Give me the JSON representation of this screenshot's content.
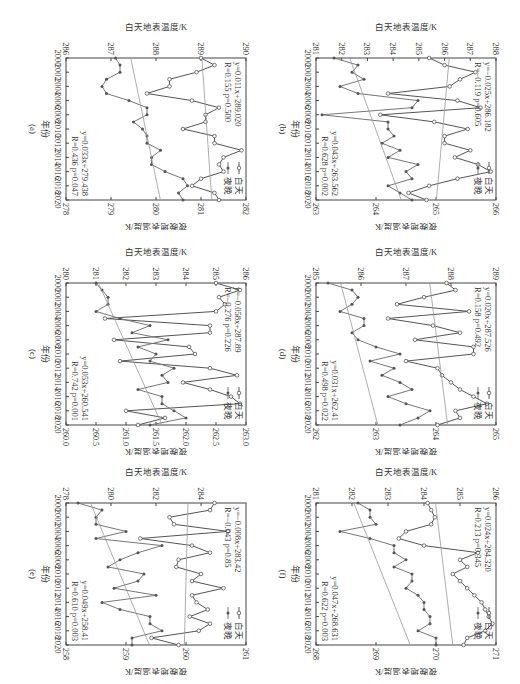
{
  "figure": {
    "rotation": "90deg clockwise",
    "legend": {
      "day": "白天",
      "night": "夜晚"
    },
    "x_label": "年份",
    "left_ylabel": "白天地表温度/K",
    "right_ylabel": "夜晚地表温度/K"
  },
  "chart_data": [
    {
      "panel": "(a)",
      "type": "line",
      "title": "(a)",
      "xlabel": "年份",
      "ylabel": "白天地表温度/K",
      "ylabel_right": "夜晚地表温度/K",
      "x": [
        2000,
        2001,
        2002,
        2003,
        2004,
        2005,
        2006,
        2007,
        2008,
        2009,
        2010,
        2011,
        2012,
        2013,
        2014,
        2015,
        2016,
        2017,
        2018,
        2019,
        2020
      ],
      "xticks": [
        2000,
        2002,
        2004,
        2006,
        2008,
        2010,
        2012,
        2014,
        2016,
        2018,
        2020
      ],
      "ylim": [
        286,
        290
      ],
      "yticks": [
        286,
        287,
        288,
        289,
        290
      ],
      "ylim_right": [
        278,
        282
      ],
      "yticks_right": [
        278,
        279,
        280,
        281,
        282
      ],
      "series": [
        {
          "name": "白天",
          "axis": "left",
          "marker": "open-circle",
          "values": [
            289.0,
            289.3,
            288.9,
            288.3,
            288.3,
            287.8,
            288.8,
            289.4,
            289.1,
            289.1,
            288.6,
            289.3,
            289.3,
            289.9,
            289.5,
            289.4,
            289.5,
            289.0,
            288.8,
            289.3,
            289.4
          ]
        },
        {
          "name": "夜晚",
          "axis": "right",
          "marker": "filled-dot",
          "values": [
            279.1,
            279.2,
            279.2,
            278.9,
            278.8,
            278.9,
            279.4,
            279.8,
            279.8,
            279.5,
            279.7,
            279.8,
            279.8,
            280.1,
            279.9,
            279.9,
            280.2,
            280.6,
            280.7,
            280.5,
            280.6
          ]
        }
      ],
      "regression": [
        {
          "series": "白天",
          "equation": "y=0.011x+289.020",
          "R": "R=0.155",
          "p": "p=0.500"
        },
        {
          "series": "夜晚",
          "equation": "y=0.033x+279.438",
          "R": "R=0.436",
          "p": "p=0.047"
        }
      ]
    },
    {
      "panel": "(b)",
      "type": "line",
      "title": "(b)",
      "xlabel": "年份",
      "ylabel": "白天地表温度/K",
      "ylabel_right": "夜晚地表温度/K",
      "x": [
        2000,
        2001,
        2002,
        2003,
        2004,
        2005,
        2006,
        2007,
        2008,
        2009,
        2010,
        2011,
        2012,
        2013,
        2014,
        2015,
        2016,
        2017,
        2018,
        2019,
        2020
      ],
      "xticks": [
        2000,
        2002,
        2004,
        2006,
        2008,
        2010,
        2012,
        2014,
        2016,
        2018,
        2020
      ],
      "ylim": [
        281,
        288
      ],
      "yticks": [
        281,
        282,
        283,
        284,
        285,
        286,
        287,
        288
      ],
      "ylim_right": [
        263,
        266
      ],
      "yticks_right": [
        263,
        264,
        265,
        266
      ],
      "series": [
        {
          "name": "白天",
          "axis": "left",
          "marker": "open-circle",
          "values": [
            285.4,
            286.0,
            287.2,
            286.6,
            286.2,
            283.8,
            286.5,
            287.4,
            283.5,
            285.6,
            286.9,
            286.0,
            286.0,
            287.0,
            286.4,
            287.3,
            287.8,
            286.5,
            285.4,
            284.6,
            285.3
          ]
        },
        {
          "name": "夜晚",
          "axis": "right",
          "marker": "filled-dot",
          "values": [
            263.3,
            263.7,
            263.6,
            263.8,
            263.4,
            263.7,
            264.7,
            264.6,
            263.1,
            264.2,
            264.2,
            264.3,
            264.1,
            264.4,
            264.2,
            264.7,
            264.5,
            264.6,
            264.2,
            264.4,
            264.6
          ]
        }
      ],
      "regression": [
        {
          "series": "白天",
          "equation": "y=−0.025x+286.182",
          "R": "R=−0.119",
          "p": "p=0.605"
        },
        {
          "series": "夜晚",
          "equation": "y=0.043x+263.562",
          "R": "R=0.628",
          "p": "p=0.002"
        }
      ]
    },
    {
      "panel": "(c)",
      "type": "line",
      "title": "(c)",
      "xlabel": "年份",
      "ylabel": "白天地表温度/K",
      "ylabel_right": "夜晚地表温度/K",
      "x": [
        2000,
        2001,
        2002,
        2003,
        2004,
        2005,
        2006,
        2007,
        2008,
        2009,
        2010,
        2011,
        2012,
        2013,
        2014,
        2015,
        2016,
        2017,
        2018,
        2019,
        2020
      ],
      "xticks": [
        2000,
        2002,
        2004,
        2006,
        2008,
        2010,
        2012,
        2014,
        2016,
        2018,
        2020
      ],
      "ylim": [
        280,
        286
      ],
      "yticks": [
        280,
        281,
        282,
        283,
        284,
        285,
        286
      ],
      "ylim_right": [
        260.0,
        263.0
      ],
      "yticks_right": [
        260.0,
        260.5,
        261.0,
        261.5,
        262.0,
        262.5,
        263.0
      ],
      "series": [
        {
          "name": "白天",
          "axis": "left",
          "marker": "open-circle",
          "values": [
            285.0,
            285.8,
            285.1,
            285.3,
            285.0,
            281.3,
            284.8,
            284.8,
            281.6,
            284.1,
            284.3,
            281.8,
            284.8,
            285.7,
            283.9,
            284.8,
            285.5,
            285.8,
            282.0,
            283.3,
            282.4
          ]
        },
        {
          "name": "夜晚",
          "axis": "right",
          "marker": "filled-dot",
          "values": [
            260.5,
            260.6,
            260.7,
            260.7,
            260.5,
            260.9,
            261.4,
            261.1,
            261.7,
            261.2,
            261.5,
            261.4,
            261.8,
            261.6,
            261.7,
            261.2,
            261.6,
            261.6,
            261.8,
            262.0,
            261.4
          ]
        }
      ],
      "regression": [
        {
          "series": "白天",
          "equation": "y=−0.058x+287.89",
          "R": "R=−0.276",
          "p": "p=0.226"
        },
        {
          "series": "夜晚",
          "equation": "y=0.053x+260.541",
          "R": "R=0.742",
          "p": "p=0.001"
        }
      ]
    },
    {
      "panel": "(d)",
      "type": "line",
      "title": "(d)",
      "xlabel": "年份",
      "ylabel": "白天地表温度/K",
      "ylabel_right": "夜晚地表温度/K",
      "x": [
        2000,
        2001,
        2002,
        2003,
        2004,
        2005,
        2006,
        2007,
        2008,
        2009,
        2010,
        2011,
        2012,
        2013,
        2014,
        2015,
        2016,
        2017,
        2018,
        2019,
        2020
      ],
      "xticks": [
        2000,
        2002,
        2004,
        2006,
        2008,
        2010,
        2012,
        2014,
        2016,
        2018,
        2020
      ],
      "ylim": [
        285,
        289
      ],
      "yticks": [
        285,
        286,
        287,
        288,
        289
      ],
      "ylim_right": [
        262,
        265
      ],
      "yticks_right": [
        262,
        263,
        264,
        265
      ],
      "series": [
        {
          "name": "白天",
          "axis": "left",
          "marker": "open-circle",
          "values": [
            287.9,
            288.1,
            287.4,
            286.8,
            288.4,
            286.6,
            287.6,
            288.2,
            287.2,
            288.5,
            288.5,
            287.0,
            287.7,
            287.8,
            288.0,
            288.2,
            288.5,
            288.8,
            288.1,
            288.2,
            287.7
          ]
        },
        {
          "name": "夜晚",
          "axis": "right",
          "marker": "filled-dot",
          "values": [
            262.2,
            262.6,
            262.7,
            262.6,
            262.4,
            262.8,
            262.8,
            262.6,
            262.7,
            263.0,
            263.4,
            262.9,
            263.3,
            263.1,
            263.4,
            263.6,
            263.2,
            263.5,
            263.9,
            263.7,
            263.4
          ]
        }
      ],
      "regression": [
        {
          "series": "白天",
          "equation": "y=0.020x+287.526",
          "R": "R=0.158",
          "p": "p=0.492"
        },
        {
          "series": "夜晚",
          "equation": "y=0.031x+262.41",
          "R": "R=0.498",
          "p": "p=0.022"
        }
      ]
    },
    {
      "panel": "(e)",
      "type": "line",
      "title": "(e)",
      "xlabel": "年份",
      "ylabel": "白天地表温度/K",
      "ylabel_right": "夜晚地表温度/K",
      "x": [
        2000,
        2001,
        2002,
        2003,
        2004,
        2005,
        2006,
        2007,
        2008,
        2009,
        2010,
        2011,
        2012,
        2013,
        2014,
        2015,
        2016,
        2017,
        2018,
        2019,
        2020
      ],
      "xticks": [
        2000,
        2002,
        2004,
        2006,
        2008,
        2010,
        2012,
        2014,
        2016,
        2018,
        2020
      ],
      "ylim": [
        278,
        286
      ],
      "yticks": [
        278,
        280,
        282,
        284
      ],
      "ylim_right": [
        258,
        261
      ],
      "yticks_right": [
        258,
        259,
        260,
        261
      ],
      "series": [
        {
          "name": "白天",
          "axis": "left",
          "marker": "open-circle",
          "values": [
            284.6,
            284.4,
            282.6,
            282.8,
            285.2,
            281.3,
            283.6,
            284.4,
            283.0,
            282.9,
            284.0,
            283.6,
            285.0,
            283.6,
            283.8,
            284.3,
            283.5,
            284.4,
            283.9,
            281.8,
            283.0
          ]
        },
        {
          "name": "夜晚",
          "axis": "right",
          "marker": "filled-dot",
          "values": [
            258.2,
            258.6,
            258.5,
            258.5,
            259.0,
            258.5,
            259.6,
            259.2,
            258.9,
            258.7,
            259.3,
            259.2,
            258.8,
            259.5,
            258.6,
            258.9,
            259.4,
            259.4,
            259.6,
            259.1,
            259.1
          ]
        }
      ],
      "regression": [
        {
          "series": "白天",
          "equation": "y=−0.008x+283.42",
          "R": "R=−0.043",
          "p": "p=0.85"
        },
        {
          "series": "夜晚",
          "equation": "y=0.049x+258.41",
          "R": "R=0.610",
          "p": "p=0.003"
        }
      ]
    },
    {
      "panel": "(f)",
      "type": "line",
      "title": "(f)",
      "xlabel": "年份",
      "ylabel": "白天地表温度/K",
      "ylabel_right": "夜晚地表温度/K",
      "x": [
        2000,
        2001,
        2002,
        2003,
        2004,
        2005,
        2006,
        2007,
        2008,
        2009,
        2010,
        2011,
        2012,
        2013,
        2014,
        2015,
        2016,
        2017,
        2018,
        2019,
        2020
      ],
      "xticks": [
        2000,
        2002,
        2004,
        2006,
        2008,
        2010,
        2012,
        2014,
        2016,
        2018,
        2020
      ],
      "ylim": [
        281,
        286
      ],
      "yticks": [
        281,
        282,
        283,
        284,
        285,
        286
      ],
      "ylim_right": [
        268,
        271
      ],
      "yticks_right": [
        268,
        269,
        270,
        271
      ],
      "series": [
        {
          "name": "白天",
          "axis": "left",
          "marker": "open-circle",
          "values": [
            284.1,
            284.2,
            284.3,
            284.2,
            283.5,
            283.3,
            284.0,
            285.5,
            285.0,
            285.2,
            284.8,
            285.0,
            285.2,
            285.4,
            285.6,
            285.7,
            285.8,
            285.9,
            285.7,
            285.2,
            285.1
          ]
        },
        {
          "name": "夜晚",
          "axis": "right",
          "marker": "filled-dot",
          "values": [
            268.7,
            268.9,
            268.9,
            269.0,
            268.4,
            268.9,
            269.3,
            269.3,
            269.5,
            269.3,
            269.6,
            269.6,
            269.5,
            269.7,
            269.8,
            269.8,
            269.9,
            269.9,
            269.7,
            270.0,
            270.0
          ]
        }
      ],
      "regression": [
        {
          "series": "白天",
          "equation": "y=0.024x+284.320",
          "R": "R=0.213",
          "p": "p=0.345"
        },
        {
          "series": "夜晚",
          "equation": "y=0.047x+268.631",
          "R": "R=0.622",
          "p": "p=0.003"
        }
      ]
    }
  ]
}
